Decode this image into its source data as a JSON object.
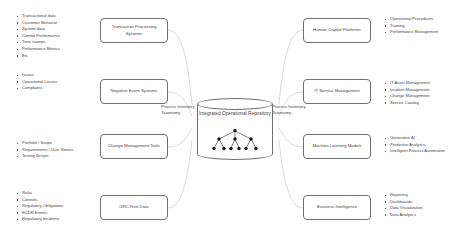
{
  "diagram": {
    "title": "Integrated Operational Repository",
    "center": {
      "repository_label": "Integrated Operational Repository",
      "left_taxonomy_label": "Process Inventory Taxonomy",
      "right_taxonomy_label": "Process Inventory Taxonomy"
    },
    "left_sources": [
      {
        "box_label": "Transaction Processing Systems",
        "items": [
          "Transactional data",
          "Customer Behavior",
          "System data",
          "Control Performance",
          "Time stamps",
          "Performance Metrics",
          "Etc."
        ]
      },
      {
        "box_label": "Negative Event Systems",
        "items": [
          "Issues",
          "Operational Losses",
          "Complaints"
        ]
      },
      {
        "box_label": "Change Management Tools",
        "items": [
          "Portfolio / Scope",
          "Requirements / User Stories",
          "Testing Scripts"
        ]
      },
      {
        "box_label": "GRC Risk Data",
        "items": [
          "Risks",
          "Controls",
          "Regulatory Obligations",
          "BCDR Events",
          "Regulatory Incidents"
        ]
      }
    ],
    "right_consumers": [
      {
        "box_label": "Human Capital Platforms",
        "items": [
          "Operational Procedures",
          "Training",
          "Performance Management"
        ]
      },
      {
        "box_label": "IT Service Management",
        "items": [
          "IT Asset Management",
          "Incident Management",
          "Change Management",
          "Service Catalog"
        ]
      },
      {
        "box_label": "Machine Learning Models",
        "items": [
          "Generative AI",
          "Predictive Analytics",
          "Intelligent Process Automation"
        ]
      },
      {
        "box_label": "Business Intelligence",
        "items": [
          "Reporting",
          "Dashboards",
          "Data Visualization",
          "Data Analytics"
        ]
      }
    ],
    "colors": {
      "stroke": "#6f6f6f",
      "text": "#3f3f3f",
      "background": "#ffffff"
    }
  }
}
